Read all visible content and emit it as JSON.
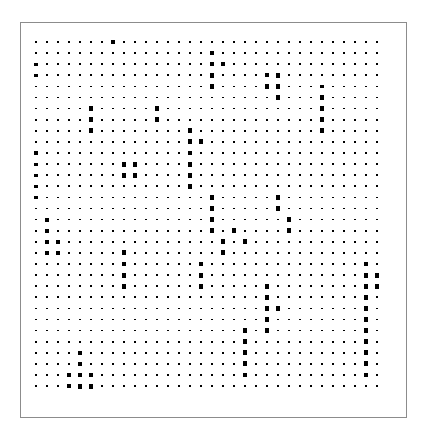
{
  "figure": {
    "type": "hinton-matrix-plot",
    "background_color": "#ffffff",
    "panel": {
      "x": 20,
      "y": 22,
      "width": 387,
      "height": 396,
      "border_color": "#8c8c8c",
      "border_width": 1,
      "fill_color": "#ffffff"
    }
  },
  "chart_data": {
    "type": "heatmap",
    "render_style": "square-marker-size-encoded",
    "title": "",
    "subtitle": "",
    "xlabel": "",
    "ylabel": "",
    "legend": null,
    "grid": false,
    "axis_ticks_visible": false,
    "axis_labels_visible": false,
    "marker_shape": "square",
    "marker_color": "#000000",
    "n_cols": 32,
    "n_rows": 32,
    "col_spacing": 11.0,
    "row_spacing": 11.1,
    "origin_x": 36,
    "origin_y": 42,
    "size_min": 1.2,
    "size_max": 5.4,
    "value_range": [
      0,
      9
    ],
    "values": [
      [
        1,
        1,
        1,
        1,
        1,
        1,
        1,
        8,
        1,
        1,
        1,
        1,
        1,
        1,
        1,
        1,
        1,
        1,
        1,
        1,
        1,
        1,
        2,
        1,
        1,
        1,
        1,
        1,
        1,
        1,
        1,
        1
      ],
      [
        1,
        1,
        1,
        1,
        1,
        1,
        1,
        1,
        1,
        1,
        1,
        1,
        1,
        1,
        1,
        1,
        7,
        1,
        1,
        2,
        1,
        1,
        1,
        1,
        1,
        1,
        1,
        1,
        1,
        1,
        1,
        1
      ],
      [
        4,
        1,
        1,
        1,
        1,
        1,
        1,
        1,
        1,
        1,
        1,
        1,
        1,
        1,
        1,
        1,
        7,
        6,
        1,
        1,
        1,
        1,
        1,
        1,
        1,
        1,
        1,
        1,
        1,
        1,
        1,
        1
      ],
      [
        4,
        1,
        1,
        1,
        1,
        1,
        1,
        1,
        1,
        1,
        1,
        1,
        1,
        1,
        1,
        1,
        7,
        1,
        1,
        1,
        1,
        6,
        7,
        1,
        1,
        1,
        1,
        1,
        1,
        1,
        1,
        1
      ],
      [
        1,
        1,
        1,
        1,
        1,
        1,
        1,
        1,
        1,
        1,
        1,
        1,
        1,
        1,
        1,
        1,
        7,
        1,
        1,
        1,
        1,
        7,
        7,
        1,
        1,
        1,
        5,
        1,
        1,
        1,
        1,
        1
      ],
      [
        1,
        1,
        1,
        1,
        1,
        1,
        1,
        1,
        1,
        1,
        1,
        1,
        1,
        1,
        1,
        1,
        1,
        1,
        1,
        1,
        1,
        1,
        7,
        1,
        1,
        1,
        7,
        1,
        1,
        1,
        1,
        1
      ],
      [
        1,
        1,
        1,
        1,
        1,
        7,
        1,
        1,
        1,
        1,
        1,
        8,
        1,
        1,
        1,
        1,
        1,
        1,
        1,
        1,
        1,
        1,
        1,
        1,
        1,
        1,
        8,
        1,
        1,
        1,
        1,
        1
      ],
      [
        1,
        1,
        1,
        1,
        1,
        8,
        1,
        1,
        1,
        1,
        1,
        8,
        1,
        1,
        1,
        1,
        1,
        1,
        1,
        1,
        1,
        1,
        1,
        1,
        1,
        1,
        8,
        1,
        1,
        1,
        1,
        1
      ],
      [
        1,
        1,
        1,
        1,
        1,
        8,
        1,
        1,
        1,
        1,
        1,
        1,
        1,
        1,
        8,
        1,
        1,
        1,
        1,
        1,
        1,
        1,
        1,
        1,
        1,
        1,
        8,
        1,
        1,
        1,
        1,
        1
      ],
      [
        1,
        1,
        1,
        1,
        1,
        1,
        1,
        1,
        1,
        1,
        1,
        1,
        1,
        1,
        8,
        8,
        1,
        1,
        1,
        1,
        1,
        1,
        1,
        1,
        1,
        1,
        1,
        1,
        1,
        1,
        1,
        1
      ],
      [
        4,
        1,
        1,
        1,
        1,
        1,
        1,
        1,
        1,
        1,
        1,
        1,
        1,
        1,
        8,
        1,
        1,
        1,
        1,
        1,
        1,
        1,
        1,
        1,
        1,
        1,
        1,
        1,
        1,
        1,
        1,
        1
      ],
      [
        4,
        1,
        1,
        1,
        1,
        1,
        1,
        1,
        8,
        8,
        1,
        1,
        1,
        1,
        8,
        1,
        1,
        1,
        1,
        1,
        1,
        1,
        1,
        1,
        1,
        1,
        1,
        1,
        1,
        1,
        1,
        1
      ],
      [
        4,
        1,
        1,
        1,
        1,
        1,
        1,
        1,
        8,
        8,
        1,
        1,
        1,
        1,
        8,
        1,
        1,
        1,
        1,
        1,
        1,
        1,
        1,
        1,
        1,
        1,
        1,
        1,
        1,
        1,
        1,
        1
      ],
      [
        4,
        1,
        1,
        1,
        1,
        1,
        1,
        1,
        1,
        1,
        1,
        1,
        1,
        1,
        8,
        1,
        1,
        1,
        1,
        1,
        1,
        1,
        1,
        1,
        1,
        1,
        1,
        1,
        1,
        1,
        1,
        1
      ],
      [
        4,
        1,
        1,
        1,
        1,
        1,
        1,
        1,
        1,
        1,
        1,
        1,
        1,
        1,
        1,
        1,
        8,
        1,
        1,
        1,
        1,
        1,
        8,
        1,
        1,
        1,
        1,
        1,
        1,
        1,
        1,
        1
      ],
      [
        1,
        1,
        1,
        1,
        1,
        1,
        1,
        1,
        1,
        1,
        1,
        1,
        1,
        1,
        1,
        1,
        8,
        1,
        1,
        1,
        1,
        1,
        8,
        1,
        1,
        1,
        1,
        1,
        1,
        1,
        1,
        1
      ],
      [
        1,
        6,
        1,
        1,
        1,
        1,
        1,
        1,
        1,
        1,
        1,
        1,
        1,
        1,
        1,
        1,
        8,
        1,
        1,
        1,
        1,
        1,
        1,
        7,
        1,
        1,
        1,
        1,
        1,
        1,
        1,
        1
      ],
      [
        1,
        6,
        1,
        1,
        1,
        1,
        1,
        1,
        1,
        1,
        1,
        1,
        1,
        1,
        1,
        1,
        8,
        1,
        8,
        1,
        1,
        1,
        1,
        7,
        1,
        1,
        1,
        1,
        1,
        1,
        1,
        1
      ],
      [
        1,
        6,
        6,
        1,
        1,
        1,
        1,
        1,
        1,
        1,
        1,
        1,
        1,
        1,
        1,
        1,
        1,
        8,
        1,
        8,
        1,
        1,
        1,
        1,
        1,
        1,
        1,
        1,
        1,
        1,
        1,
        1
      ],
      [
        1,
        6,
        6,
        1,
        1,
        1,
        1,
        1,
        8,
        1,
        1,
        1,
        1,
        1,
        1,
        1,
        1,
        8,
        1,
        1,
        1,
        1,
        1,
        1,
        1,
        1,
        1,
        1,
        1,
        1,
        1,
        1
      ],
      [
        1,
        1,
        1,
        1,
        1,
        1,
        1,
        1,
        8,
        1,
        1,
        1,
        1,
        1,
        1,
        8,
        1,
        1,
        1,
        1,
        1,
        1,
        1,
        1,
        1,
        1,
        1,
        1,
        1,
        1,
        7,
        1
      ],
      [
        1,
        1,
        1,
        1,
        1,
        1,
        1,
        1,
        8,
        1,
        1,
        1,
        1,
        1,
        1,
        8,
        1,
        1,
        1,
        1,
        1,
        1,
        1,
        1,
        1,
        1,
        1,
        1,
        1,
        1,
        8,
        8
      ],
      [
        1,
        1,
        1,
        1,
        1,
        1,
        1,
        1,
        8,
        1,
        1,
        1,
        1,
        1,
        1,
        8,
        1,
        1,
        1,
        1,
        1,
        8,
        1,
        1,
        1,
        1,
        1,
        1,
        1,
        1,
        8,
        8
      ],
      [
        1,
        1,
        1,
        1,
        1,
        1,
        1,
        1,
        1,
        1,
        1,
        1,
        1,
        1,
        1,
        1,
        1,
        1,
        1,
        1,
        1,
        8,
        1,
        1,
        1,
        1,
        1,
        1,
        1,
        1,
        8,
        1
      ],
      [
        1,
        1,
        1,
        1,
        1,
        1,
        1,
        1,
        1,
        1,
        1,
        1,
        1,
        1,
        1,
        1,
        1,
        1,
        1,
        1,
        1,
        8,
        8,
        1,
        1,
        1,
        1,
        1,
        1,
        1,
        8,
        1
      ],
      [
        1,
        1,
        1,
        1,
        1,
        1,
        1,
        1,
        1,
        1,
        1,
        1,
        1,
        1,
        1,
        1,
        1,
        1,
        1,
        1,
        1,
        8,
        1,
        1,
        1,
        1,
        1,
        1,
        1,
        1,
        8,
        1
      ],
      [
        1,
        1,
        1,
        1,
        1,
        1,
        1,
        1,
        1,
        1,
        1,
        1,
        1,
        1,
        1,
        1,
        1,
        1,
        1,
        8,
        1,
        8,
        1,
        1,
        1,
        1,
        1,
        1,
        1,
        1,
        8,
        1
      ],
      [
        1,
        1,
        1,
        1,
        1,
        1,
        1,
        1,
        1,
        1,
        1,
        1,
        1,
        1,
        1,
        1,
        1,
        1,
        1,
        8,
        1,
        1,
        1,
        1,
        1,
        1,
        1,
        1,
        1,
        1,
        8,
        1
      ],
      [
        1,
        1,
        1,
        1,
        7,
        1,
        1,
        1,
        1,
        1,
        1,
        1,
        1,
        1,
        1,
        1,
        1,
        1,
        1,
        8,
        1,
        1,
        1,
        1,
        1,
        1,
        1,
        1,
        1,
        1,
        8,
        1
      ],
      [
        1,
        1,
        1,
        1,
        7,
        1,
        1,
        1,
        1,
        1,
        1,
        1,
        1,
        1,
        1,
        1,
        1,
        1,
        1,
        8,
        1,
        1,
        1,
        1,
        1,
        1,
        1,
        1,
        1,
        1,
        8,
        1
      ],
      [
        1,
        1,
        1,
        7,
        8,
        8,
        1,
        1,
        1,
        1,
        1,
        1,
        1,
        1,
        1,
        1,
        1,
        1,
        1,
        8,
        1,
        1,
        1,
        1,
        1,
        1,
        1,
        1,
        1,
        1,
        8,
        1
      ],
      [
        1,
        1,
        1,
        7,
        8,
        8,
        1,
        1,
        1,
        1,
        1,
        1,
        1,
        1,
        1,
        1,
        1,
        1,
        1,
        1,
        1,
        1,
        1,
        1,
        1,
        1,
        1,
        1,
        1,
        1,
        1,
        1
      ]
    ]
  }
}
